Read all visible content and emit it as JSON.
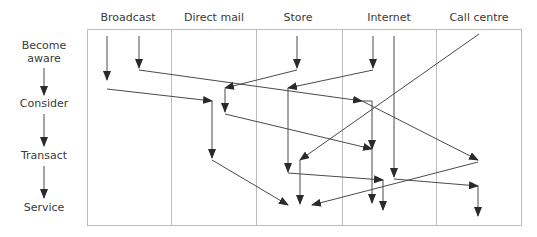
{
  "diagram": {
    "columns": [
      "Broadcast",
      "Direct mail",
      "Store",
      "Internet",
      "Call centre"
    ],
    "stages": [
      {
        "lines": [
          "Become",
          "aware"
        ]
      },
      {
        "lines": [
          "Consider"
        ]
      },
      {
        "lines": [
          "Transact"
        ]
      },
      {
        "lines": [
          "Service"
        ]
      }
    ],
    "colors": {
      "line": "#4a4a4a",
      "grid": "#bdbdbd",
      "text": "#3a3a3a"
    }
  }
}
